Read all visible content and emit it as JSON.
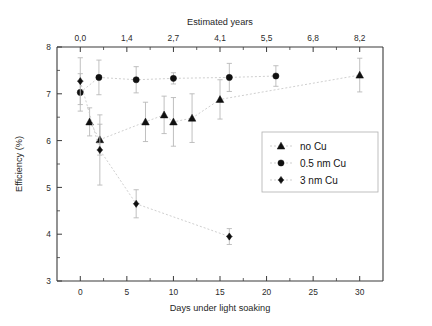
{
  "chart_data": {
    "type": "scatter",
    "title": "",
    "xlabel": "Days under light soaking",
    "ylabel": "Efficiency (%)",
    "top_axis_label": "Estimated years",
    "xlim": [
      -2.5,
      32.5
    ],
    "ylim": [
      3,
      8
    ],
    "x_ticks": [
      0,
      5,
      10,
      15,
      20,
      25,
      30
    ],
    "x_tick_labels": [
      "0",
      "5",
      "10",
      "15",
      "20",
      "25",
      "30"
    ],
    "y_ticks": [
      3,
      4,
      5,
      6,
      7,
      8
    ],
    "y_tick_labels": [
      "3",
      "4",
      "5",
      "6",
      "7",
      "8"
    ],
    "top_ticks_days": [
      0,
      5,
      10,
      15,
      20,
      25,
      30
    ],
    "top_tick_labels": [
      "0,0",
      "1,4",
      "2,7",
      "4,1",
      "5,5",
      "6,8",
      "8,2"
    ],
    "grid": false,
    "legend_position": "center-right",
    "series": [
      {
        "name": "no Cu",
        "marker": "triangle",
        "color": "#101010",
        "points": [
          {
            "x": 1.0,
            "y": 6.4,
            "err": 0.3
          },
          {
            "x": 2.1,
            "y": 6.02,
            "err": 0.33
          },
          {
            "x": 7.0,
            "y": 6.4,
            "err": 0.42
          },
          {
            "x": 9.0,
            "y": 6.55,
            "err": 0.4
          },
          {
            "x": 10.0,
            "y": 6.4,
            "err": 0.52
          },
          {
            "x": 12.0,
            "y": 6.48,
            "err": 0.52
          },
          {
            "x": 15.0,
            "y": 6.88,
            "err": 0.42
          },
          {
            "x": 30.0,
            "y": 7.4,
            "err": 0.36
          }
        ]
      },
      {
        "name": "0.5 nm Cu",
        "marker": "circle",
        "color": "#101010",
        "points": [
          {
            "x": 0.0,
            "y": 7.03,
            "err": 0.4
          },
          {
            "x": 2.0,
            "y": 7.35,
            "err": 0.37
          },
          {
            "x": 6.0,
            "y": 7.3,
            "err": 0.28
          },
          {
            "x": 10.0,
            "y": 7.33,
            "err": 0.12
          },
          {
            "x": 16.0,
            "y": 7.35,
            "err": 0.3
          },
          {
            "x": 21.0,
            "y": 7.38,
            "err": 0.22
          }
        ]
      },
      {
        "name": "3 nm Cu",
        "marker": "diamond",
        "color": "#101010",
        "points": [
          {
            "x": 0.0,
            "y": 7.27,
            "err": 0.5
          },
          {
            "x": 2.1,
            "y": 5.8,
            "err": 0.75
          },
          {
            "x": 6.0,
            "y": 4.65,
            "err": 0.3
          },
          {
            "x": 16.0,
            "y": 3.95,
            "err": 0.17
          }
        ]
      }
    ]
  },
  "legend": {
    "items": [
      {
        "label": "no Cu",
        "marker": "triangle"
      },
      {
        "label": "0.5 nm Cu",
        "marker": "circle"
      },
      {
        "label": "3 nm Cu",
        "marker": "diamond"
      }
    ]
  }
}
